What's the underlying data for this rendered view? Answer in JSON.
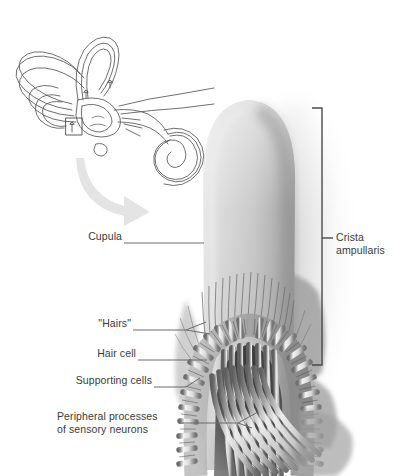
{
  "figure": {
    "background_color": "#ffffff",
    "width": 396,
    "height": 476
  },
  "inset": {
    "name": "bony-labyrinth-inset",
    "description": "Line drawing of the inner ear labyrinth with semicircular canals, vestibule and cochlea",
    "highlight_box_label": "",
    "line_color": "#555555"
  },
  "magnify_arrow": {
    "name": "magnification-arrow",
    "color": "#e2e2e2",
    "direction": "down-right"
  },
  "labels": [
    {
      "id": "cupula",
      "text": "Cupula",
      "side": "left",
      "x": 78,
      "y": 237,
      "leader_x1": 122,
      "leader_x2": 203,
      "leader_y": 243
    },
    {
      "id": "hairs",
      "text": "\"Hairs\"",
      "side": "left",
      "x": 84,
      "y": 324,
      "leader_x1": 131,
      "leader_x2": 195,
      "leader_y": 330
    },
    {
      "id": "hair-cell",
      "text": "Hair cell",
      "side": "left",
      "x": 79,
      "y": 354,
      "leader_x1": 136,
      "leader_x2": 205,
      "leader_y": 360
    },
    {
      "id": "supporting-cells",
      "text": "Supporting cells",
      "side": "left",
      "x": 57,
      "y": 381,
      "leader_x1": 152,
      "leader_x2": 196,
      "leader_y": 387
    },
    {
      "id": "peripheral-processes",
      "text": "Peripheral processes\nof sensory neurons",
      "side": "left",
      "x": 57,
      "y": 417,
      "leader_x1": 177,
      "leader_x2": 246,
      "leader_y": 423
    },
    {
      "id": "crista-ampullaris",
      "text": "Crista\nampullaris",
      "side": "right",
      "x": 335,
      "y": 232,
      "leader_x1": 325,
      "leader_x2": 334,
      "leader_y": 238
    }
  ],
  "bracket": {
    "name": "crista-ampullaris-bracket",
    "x": 322,
    "y_top": 108,
    "y_bottom": 365,
    "tick_length": 10,
    "color": "#4a4a4a"
  },
  "colors": {
    "text": "#3a3a3a",
    "leader": "#6b6b6b",
    "bracket": "#4a4a4a",
    "cupula_light": "#d8d8d8",
    "cupula_mid": "#b9b9b9",
    "cupula_dark": "#8f8f8f",
    "epithelium": "#9a9a9a",
    "stipple": "#a5a5a5",
    "nerve": "#c9c9c9",
    "inset_line": "#555555",
    "arrow": "#e3e3e3"
  }
}
